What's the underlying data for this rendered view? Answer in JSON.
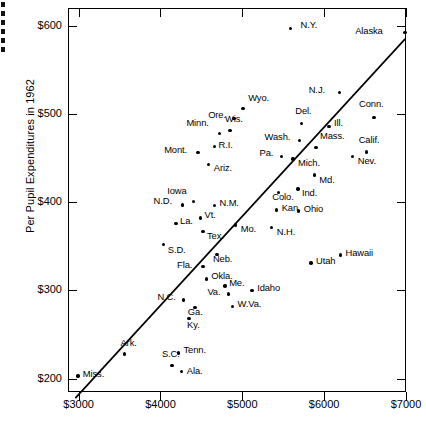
{
  "chart_data": {
    "type": "scatter",
    "title": "",
    "xlabel": "",
    "ylabel": "Per Pupil Expenditures in 1962",
    "xlim": [
      2870,
      7000
    ],
    "ylim": [
      185,
      620
    ],
    "grid": false,
    "legend": null,
    "x_ticks": [
      "$3000",
      "$4000",
      "$5000",
      "$6000",
      "$7000"
    ],
    "x_tick_values": [
      3000,
      4000,
      5000,
      6000,
      7000
    ],
    "y_ticks": [
      "$200",
      "$300",
      "$400",
      "$500",
      "$600"
    ],
    "y_tick_values": [
      200,
      300,
      400,
      500,
      600
    ],
    "trendline": {
      "label": "regression-line",
      "x0": 2960,
      "y0": 178,
      "x1": 6990,
      "y1": 585
    },
    "points": [
      {
        "label": "N.Y.",
        "x": 5590,
        "y": 597,
        "lx": 10,
        "ly": -4
      },
      {
        "label": "Alaska",
        "x": 6990,
        "y": 592,
        "lx": -50,
        "ly": -3
      },
      {
        "label": "N.J.",
        "x": 6190,
        "y": 524,
        "lx": -31,
        "ly": -4
      },
      {
        "label": "Conn.",
        "x": 6610,
        "y": 496,
        "lx": -15,
        "ly": -14
      },
      {
        "label": "Wyo.",
        "x": 5010,
        "y": 506,
        "lx": 5,
        "ly": -12
      },
      {
        "label": "Ore.",
        "x": 4900,
        "y": 495,
        "lx": -26,
        "ly": -4
      },
      {
        "label": "Del.",
        "x": 5720,
        "y": 489,
        "lx": -6,
        "ly": -14
      },
      {
        "label": "Ill.",
        "x": 6060,
        "y": 486,
        "lx": 5,
        "ly": -4
      },
      {
        "label": "Wis.",
        "x": 4850,
        "y": 481,
        "lx": -5,
        "ly": -13
      },
      {
        "label": "Minn.",
        "x": 4720,
        "y": 478,
        "lx": -33,
        "ly": -11
      },
      {
        "label": "Calif.",
        "x": 6520,
        "y": 457,
        "lx": -8,
        "ly": -13
      },
      {
        "label": "Mass.",
        "x": 5900,
        "y": 462,
        "lx": 4,
        "ly": -12
      },
      {
        "label": "Wash.",
        "x": 5700,
        "y": 470,
        "lx": -35,
        "ly": -4
      },
      {
        "label": "R.I.",
        "x": 4660,
        "y": 463,
        "lx": 4,
        "ly": -3
      },
      {
        "label": "Mont.",
        "x": 4460,
        "y": 456,
        "lx": -34,
        "ly": -4
      },
      {
        "label": "Pa.",
        "x": 5480,
        "y": 452,
        "lx": -22,
        "ly": -4
      },
      {
        "label": "Mich.",
        "x": 5620,
        "y": 449,
        "lx": 5,
        "ly": 3
      },
      {
        "label": "Nev.",
        "x": 6350,
        "y": 452,
        "lx": 5,
        "ly": 4
      },
      {
        "label": "Ariz.",
        "x": 4590,
        "y": 443,
        "lx": 5,
        "ly": 3
      },
      {
        "label": "Md.",
        "x": 5880,
        "y": 431,
        "lx": 5,
        "ly": 4
      },
      {
        "label": "Colo.",
        "x": 5440,
        "y": 411,
        "lx": -6,
        "ly": 4
      },
      {
        "label": "Ind.",
        "x": 5680,
        "y": 415,
        "lx": 4,
        "ly": 3
      },
      {
        "label": "Iowa",
        "x": 4400,
        "y": 401,
        "lx": -26,
        "ly": -11
      },
      {
        "label": "N.D.",
        "x": 4270,
        "y": 397,
        "lx": -29,
        "ly": -5
      },
      {
        "label": "N.M.",
        "x": 4660,
        "y": 396,
        "lx": 5,
        "ly": -4
      },
      {
        "label": "Kan.",
        "x": 5420,
        "y": 391,
        "lx": 5,
        "ly": -3
      },
      {
        "label": "Ohio",
        "x": 5690,
        "y": 390,
        "lx": 5,
        "ly": -3
      },
      {
        "label": "Vt.",
        "x": 4490,
        "y": 382,
        "lx": 4,
        "ly": -4
      },
      {
        "label": "La.",
        "x": 4190,
        "y": 376,
        "lx": 4,
        "ly": -3
      },
      {
        "label": "Mo.",
        "x": 4920,
        "y": 374,
        "lx": 5,
        "ly": 3
      },
      {
        "label": "N.H.",
        "x": 5360,
        "y": 371,
        "lx": 5,
        "ly": 3
      },
      {
        "label": "Tex.",
        "x": 4520,
        "y": 367,
        "lx": 4,
        "ly": 4
      },
      {
        "label": "S.D.",
        "x": 4040,
        "y": 352,
        "lx": 4,
        "ly": 4
      },
      {
        "label": "Hawaii",
        "x": 6200,
        "y": 340,
        "lx": 5,
        "ly": -3
      },
      {
        "label": "Neb.",
        "x": 4690,
        "y": 341,
        "lx": -4,
        "ly": 4
      },
      {
        "label": "Utah",
        "x": 5840,
        "y": 331,
        "lx": 5,
        "ly": -3
      },
      {
        "label": "Fla.",
        "x": 4520,
        "y": 327,
        "lx": -26,
        "ly": -3
      },
      {
        "label": "Okla.",
        "x": 4560,
        "y": 313,
        "lx": 5,
        "ly": -4
      },
      {
        "label": "Me.",
        "x": 4790,
        "y": 305,
        "lx": 4,
        "ly": -4
      },
      {
        "label": "Idaho",
        "x": 5120,
        "y": 300,
        "lx": 5,
        "ly": -3
      },
      {
        "label": "Va.",
        "x": 4830,
        "y": 296,
        "lx": -21,
        "ly": -3
      },
      {
        "label": "N.C.",
        "x": 4280,
        "y": 289,
        "lx": -26,
        "ly": -4
      },
      {
        "label": "W.Va.",
        "x": 4880,
        "y": 282,
        "lx": 5,
        "ly": -3
      },
      {
        "label": "Ga.",
        "x": 4420,
        "y": 281,
        "lx": -7,
        "ly": 4
      },
      {
        "label": "Ky.",
        "x": 4350,
        "y": 268,
        "lx": -2,
        "ly": 5
      },
      {
        "label": "Tenn.",
        "x": 4220,
        "y": 229,
        "lx": 5,
        "ly": -4
      },
      {
        "label": "Ark.",
        "x": 3560,
        "y": 228,
        "lx": -4,
        "ly": -12
      },
      {
        "label": "S.C.",
        "x": 4140,
        "y": 215,
        "lx": -10,
        "ly": -13
      },
      {
        "label": "Ala.",
        "x": 4260,
        "y": 208,
        "lx": 5,
        "ly": -2
      },
      {
        "label": "Miss.",
        "x": 2990,
        "y": 203,
        "lx": 5,
        "ly": -3
      }
    ]
  }
}
